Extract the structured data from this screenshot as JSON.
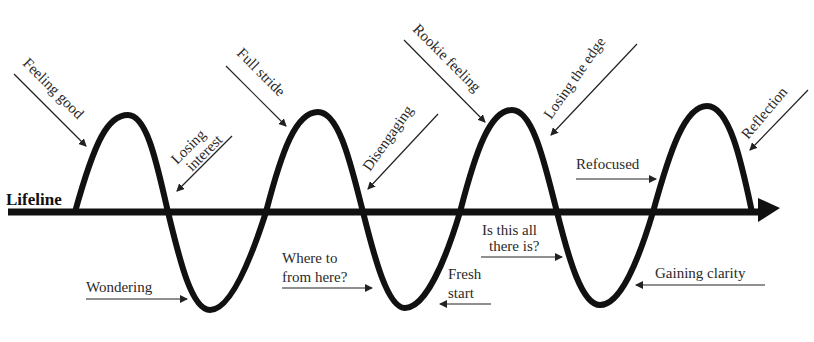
{
  "diagram": {
    "axis_label": "Lifeline",
    "colors": {
      "ink": "#111111",
      "text": "#2a2a2a",
      "background": "#ffffff"
    },
    "labels": {
      "feeling_good": "Feeling good",
      "losing_interest_1": "Losing",
      "losing_interest_2": "interest",
      "wondering": "Wondering",
      "full_stride": "Full stride",
      "disengaging": "Disengaging",
      "where_to_1": "Where to",
      "where_to_2": "from here?",
      "rookie_feeling": "Rookie feeling",
      "fresh_start_1": "Fresh",
      "fresh_start_2": "start",
      "losing_the_edge": "Losing the edge",
      "is_this_all_1": "Is this all",
      "is_this_all_2": "there is?",
      "refocused": "Refocused",
      "gaining_clarity": "Gaining clarity",
      "reflection": "Reflection"
    }
  }
}
